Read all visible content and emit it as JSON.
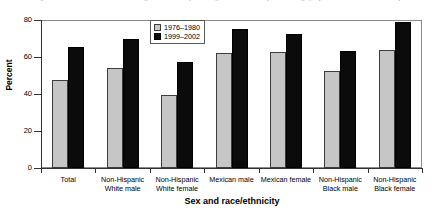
{
  "chart_data": {
    "type": "bar",
    "title": "Figure 4. Prevalence of overweight or obesity among adults 20-74 years of age, by sex and race/ethnicity",
    "xlabel": "Sex and race/ethnicity",
    "ylabel": "Percent",
    "ylim": [
      0,
      80
    ],
    "yticks": [
      0,
      20,
      40,
      60,
      80
    ],
    "grid": false,
    "legend_position": "top-center-inside",
    "categories": [
      "Total",
      "Non-Hispanic\nWhite male",
      "Non-Hispanic\nWhite female",
      "Mexican male",
      "Mexican female",
      "Non-Hispanic\nBlack male",
      "Non-Hispanic\nBlack female"
    ],
    "series": [
      {
        "name": "1976–1980",
        "color": "#c6c6c6",
        "values": [
          47.5,
          54.0,
          39.5,
          62.0,
          62.5,
          52.5,
          64.0
        ]
      },
      {
        "name": "1999–2002",
        "color": "#0b0b0b",
        "values": [
          65.5,
          70.0,
          57.5,
          75.0,
          72.5,
          63.0,
          79.0
        ]
      }
    ]
  }
}
